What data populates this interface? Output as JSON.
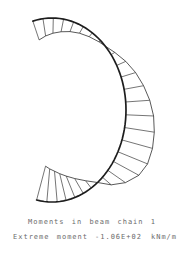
{
  "page": {
    "background": "#ffffff",
    "ink_color": "#1d1d1d"
  },
  "caption": {
    "line1": "Moments in beam chain 1",
    "line2_label": "Extreme moment",
    "line2_value": "-1.06E+02",
    "line2_unit": "kNm/m"
  },
  "chart_data": {
    "type": "line",
    "subtype": "bending-moment-diagram-on-curved-beam",
    "title": "Moments in beam chain 1",
    "ylabel": "Bending moment",
    "units": "kNm/m",
    "extreme_moment": -106,
    "extreme_moment_text": "-1.06E+02",
    "legend_position": "none",
    "grid": false,
    "beam_geometry": {
      "shape": "elliptical-arc-open-left",
      "center_x": 52,
      "center_y": 110,
      "radius_x": 74,
      "radius_y": 92,
      "angle_start_deg": -105,
      "angle_end_deg": 102
    },
    "moment_scale_px_per_unit": 0.33,
    "sign_convention": "positive moments hatched outside the arc, negative inside",
    "zero_crossings_deg": [
      -44,
      52
    ],
    "stations": [
      {
        "angle_deg": -105,
        "moment": -60
      },
      {
        "angle_deg": -97,
        "moment": -53
      },
      {
        "angle_deg": -89,
        "moment": -46
      },
      {
        "angle_deg": -81,
        "moment": -39
      },
      {
        "angle_deg": -73,
        "moment": -31
      },
      {
        "angle_deg": -65,
        "moment": -23
      },
      {
        "angle_deg": -57,
        "moment": -15
      },
      {
        "angle_deg": -49,
        "moment": -6
      },
      {
        "angle_deg": -44,
        "moment": 0
      },
      {
        "angle_deg": -37,
        "moment": 13
      },
      {
        "angle_deg": -29,
        "moment": 30
      },
      {
        "angle_deg": -21,
        "moment": 46
      },
      {
        "angle_deg": -13,
        "moment": 60
      },
      {
        "angle_deg": -5,
        "moment": 73
      },
      {
        "angle_deg": 3,
        "moment": 84
      },
      {
        "angle_deg": 11,
        "moment": 91
      },
      {
        "angle_deg": 19,
        "moment": 96
      },
      {
        "angle_deg": 27,
        "moment": 97
      },
      {
        "angle_deg": 34,
        "moment": 88
      },
      {
        "angle_deg": 41,
        "moment": 65
      },
      {
        "angle_deg": 47,
        "moment": 35
      },
      {
        "angle_deg": 52,
        "moment": 0
      },
      {
        "angle_deg": 58,
        "moment": -28
      },
      {
        "angle_deg": 65,
        "moment": -52
      },
      {
        "angle_deg": 72,
        "moment": -70
      },
      {
        "angle_deg": 79,
        "moment": -83
      },
      {
        "angle_deg": 86,
        "moment": -93
      },
      {
        "angle_deg": 94,
        "moment": -100
      },
      {
        "angle_deg": 102,
        "moment": -106
      }
    ]
  }
}
